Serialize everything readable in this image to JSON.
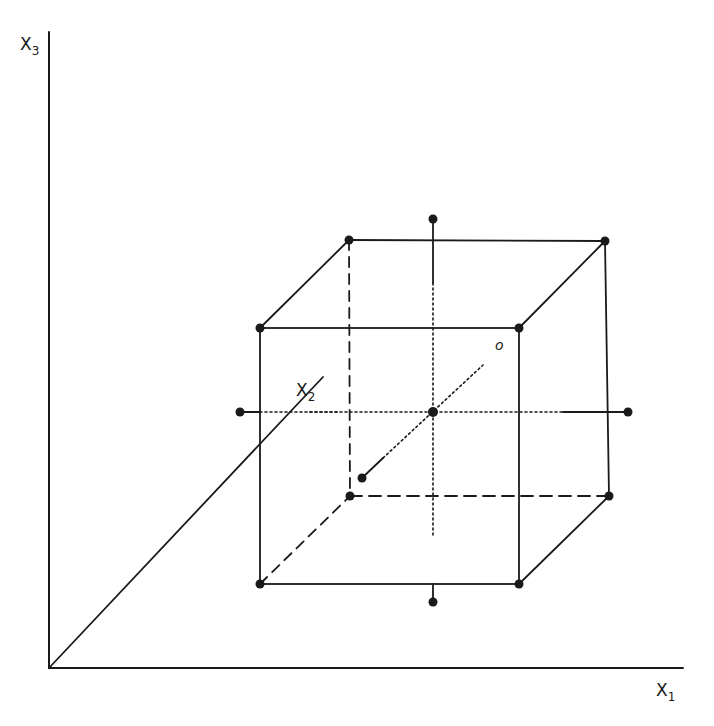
{
  "diagram": {
    "type": "central-composite-design",
    "ink_color": "#1a1a1a",
    "background": "#ffffff",
    "axes": {
      "x1": {
        "label": "X",
        "subscript": "1"
      },
      "x2": {
        "label": "X",
        "subscript": "2"
      },
      "x3": {
        "label": "X",
        "subscript": "3"
      }
    },
    "center_label": "o",
    "cube": {
      "front_face": [
        [
          260,
          328
        ],
        [
          519,
          328
        ],
        [
          519,
          584
        ],
        [
          260,
          584
        ]
      ],
      "back_face": [
        [
          349,
          240
        ],
        [
          605,
          241
        ],
        [
          609,
          496
        ],
        [
          350,
          496
        ]
      ]
    },
    "center_point": [
      433,
      412
    ],
    "axial_points": {
      "top": [
        433,
        219
      ],
      "bottom": [
        433,
        602
      ],
      "left": [
        240,
        412
      ],
      "right": [
        628,
        412
      ],
      "near": [
        362,
        478
      ]
    }
  }
}
